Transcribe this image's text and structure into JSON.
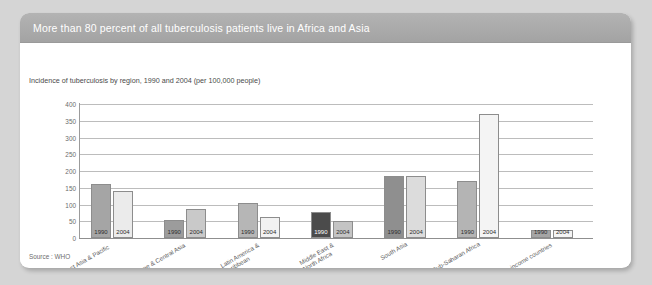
{
  "card": {
    "title": "More than 80 percent of all tuberculosis patients live in Africa and Asia",
    "source_note": "Source : WHO"
  },
  "chart_data": {
    "type": "bar",
    "title": "Incidence of tuberculosis by region, 1990 and 2004 (per 100,000 people)",
    "xlabel": "",
    "ylabel": "",
    "ylim": [
      0,
      400
    ],
    "yticks": [
      0,
      50,
      100,
      150,
      200,
      250,
      300,
      350,
      400
    ],
    "grid": true,
    "legend": "none",
    "bar_value_labels": [
      "1990",
      "2004"
    ],
    "categories": [
      "East Asia & Pacific",
      "Europe & Central Asia",
      "Latin America &\nCaribbean",
      "Middle East &\nNorth Africa",
      "South Asia",
      "Sub-Saharan Africa",
      "High-income countries"
    ],
    "series": [
      {
        "name": "1990",
        "color": "#a5a5a5",
        "values": [
          160,
          53,
          105,
          78,
          186,
          171,
          10
        ]
      },
      {
        "name": "2004",
        "color": "#ebebeb",
        "values": [
          141,
          88,
          62,
          52,
          185,
          370,
          5
        ]
      }
    ],
    "bar_colors": {
      "1990_default": "#a5a5a5",
      "1990_dark": "#4b4b4b",
      "2004_default": "#ebebeb",
      "2004_mid": "#d2d2d2",
      "border": "#8d8d8d"
    },
    "bar_color_overrides": {
      "1990": [
        "#a5a5a5",
        "#9c9c9c",
        "#b6b6b6",
        "#4b4b4b",
        "#8f8f8f",
        "#b4b4b4",
        "#a5a5a5"
      ],
      "2004": [
        "#ebebeb",
        "#c9c9c9",
        "#f2f2f2",
        "#c4c4c4",
        "#dcdcdc",
        "#f4f4f4",
        "#f4f4f4"
      ]
    }
  },
  "theme": {
    "page_background": "#d5d5d5",
    "card_background": "#ffffff",
    "header_background": "#a9a9a9",
    "header_text": "#ffffff",
    "gridline": "#bcbcbc",
    "axis": "#8f8f8f",
    "text": "#5a5a5a"
  }
}
